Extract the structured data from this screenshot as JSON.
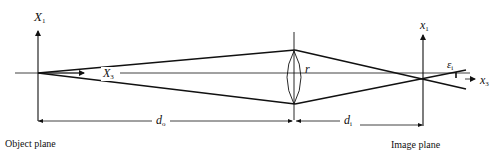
{
  "diagram": {
    "type": "thin-lens imaging geometry",
    "labels": {
      "object_axis_vertical": {
        "base": "X",
        "sub": "1"
      },
      "object_axis_optical": {
        "base": "X",
        "sub": "3"
      },
      "image_axis_vertical": {
        "base": "x",
        "sub": "1"
      },
      "image_axis_optical": {
        "base": "x",
        "sub": "3"
      },
      "lens_radius": "r",
      "object_distance": {
        "base": "d",
        "sub": "o"
      },
      "image_distance": {
        "base": "d",
        "sub": "i"
      },
      "image_angle": {
        "base": "ε",
        "sub": "i"
      },
      "object_plane": "Object plane",
      "image_plane": "Image plane"
    },
    "colors": {
      "line": "#111111",
      "background": "#ffffff"
    }
  }
}
